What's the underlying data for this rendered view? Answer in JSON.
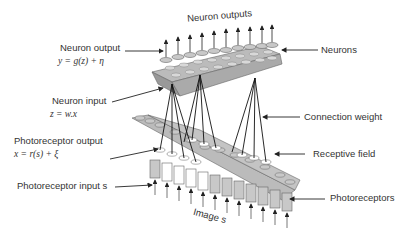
{
  "diagram": {
    "title_top": "Neuron outputs",
    "title_bottom": "Image s",
    "labels": {
      "neuron_output": "Neuron output",
      "neuron_output_eq": "y = g(z) + η",
      "neuron_input": "Neuron input",
      "neuron_input_eq": "z = w.x",
      "photoreceptor_output": "Photoreceptor output",
      "photoreceptor_output_eq": "x = r(s) + ξ",
      "photoreceptor_input": "Photoreceptor input s",
      "neurons": "Neurons",
      "connection_weight": "Connection weight",
      "receptive_field": "Receptive field",
      "photoreceptors": "Photoreceptors"
    },
    "colors": {
      "cylinder_fill": "#c8c8c8",
      "cylinder_highlight": "#ffffff",
      "line": "#222222",
      "text": "#333333"
    }
  }
}
